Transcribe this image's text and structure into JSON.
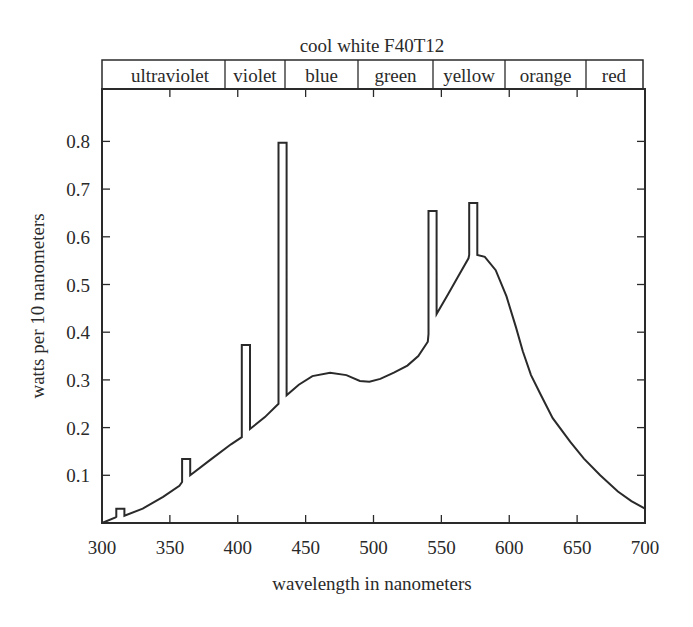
{
  "chart_data": {
    "type": "line",
    "title": "cool white F40T12",
    "xlabel": "wavelength in nanometers",
    "ylabel": "watts per 10 nanometers",
    "xlim": [
      300,
      700
    ],
    "ylim": [
      0,
      0.9
    ],
    "grid": false,
    "legend": null,
    "x_ticks": [
      300,
      350,
      400,
      450,
      500,
      550,
      600,
      650,
      700
    ],
    "y_ticks": [
      0.1,
      0.2,
      0.3,
      0.4,
      0.5,
      0.6,
      0.7,
      0.8
    ],
    "color_bands": [
      {
        "label": "ultraviolet",
        "start": 300,
        "end": 390
      },
      {
        "label": "violet",
        "start": 390,
        "end": 435
      },
      {
        "label": "blue",
        "start": 435,
        "end": 489
      },
      {
        "label": "green",
        "start": 489,
        "end": 544
      },
      {
        "label": "yellow",
        "start": 544,
        "end": 597
      },
      {
        "label": "orange",
        "start": 597,
        "end": 657
      },
      {
        "label": "red",
        "start": 657,
        "end": 698
      }
    ],
    "series": [
      {
        "name": "cool white F40T12",
        "points": [
          [
            300,
            0.0
          ],
          [
            310,
            0.012
          ],
          [
            310.5,
            0.013
          ],
          [
            310.5,
            0.03
          ],
          [
            316.5,
            0.03
          ],
          [
            316.5,
            0.015
          ],
          [
            330,
            0.03
          ],
          [
            345,
            0.055
          ],
          [
            357,
            0.078
          ],
          [
            359,
            0.086
          ],
          [
            359,
            0.134
          ],
          [
            365,
            0.134
          ],
          [
            365,
            0.1
          ],
          [
            380,
            0.133
          ],
          [
            395,
            0.165
          ],
          [
            403,
            0.18
          ],
          [
            403,
            0.373
          ],
          [
            409,
            0.373
          ],
          [
            409,
            0.197
          ],
          [
            420,
            0.222
          ],
          [
            430,
            0.25
          ],
          [
            430,
            0.797
          ],
          [
            436,
            0.797
          ],
          [
            436,
            0.268
          ],
          [
            445,
            0.29
          ],
          [
            455,
            0.308
          ],
          [
            468,
            0.315
          ],
          [
            480,
            0.31
          ],
          [
            490,
            0.298
          ],
          [
            497,
            0.296
          ],
          [
            505,
            0.302
          ],
          [
            515,
            0.315
          ],
          [
            525,
            0.33
          ],
          [
            533,
            0.35
          ],
          [
            540,
            0.38
          ],
          [
            540.5,
            0.396
          ],
          [
            540.5,
            0.654
          ],
          [
            546.5,
            0.654
          ],
          [
            546.5,
            0.438
          ],
          [
            555,
            0.48
          ],
          [
            562,
            0.515
          ],
          [
            570,
            0.555
          ],
          [
            570.5,
            0.562
          ],
          [
            570.5,
            0.671
          ],
          [
            576.5,
            0.671
          ],
          [
            576.5,
            0.562
          ],
          [
            582,
            0.558
          ],
          [
            590,
            0.53
          ],
          [
            598,
            0.475
          ],
          [
            605,
            0.41
          ],
          [
            610,
            0.36
          ],
          [
            616,
            0.31
          ],
          [
            623,
            0.27
          ],
          [
            632,
            0.22
          ],
          [
            645,
            0.17
          ],
          [
            655,
            0.135
          ],
          [
            667,
            0.1
          ],
          [
            680,
            0.066
          ],
          [
            690,
            0.046
          ],
          [
            700,
            0.03
          ]
        ]
      }
    ],
    "annotations": [
      {
        "label": "emission line",
        "x": 313,
        "peak": 0.03
      },
      {
        "label": "emission line",
        "x": 362,
        "peak": 0.134
      },
      {
        "label": "emission line",
        "x": 406,
        "peak": 0.373
      },
      {
        "label": "emission line",
        "x": 433,
        "peak": 0.797
      },
      {
        "label": "emission line",
        "x": 543,
        "peak": 0.654
      },
      {
        "label": "emission line",
        "x": 573,
        "peak": 0.671
      }
    ]
  },
  "style": {
    "line_color": "#2a2a2a",
    "background": "#ffffff"
  }
}
